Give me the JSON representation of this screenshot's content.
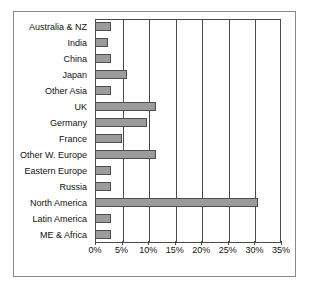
{
  "chart_data": {
    "type": "bar",
    "orientation": "horizontal",
    "title": "",
    "subtitle": "",
    "xlabel": "",
    "ylabel": "",
    "xlim": [
      0,
      35
    ],
    "xtick_labels": [
      "0%",
      "5%",
      "10%",
      "15%",
      "20%",
      "25%",
      "30%",
      "35%"
    ],
    "xtick_values": [
      0,
      5,
      10,
      15,
      20,
      25,
      30,
      35
    ],
    "grid": true,
    "grid_axis": "x",
    "legend": false,
    "legend_position": "none",
    "categories": [
      "Australia & NZ",
      "India",
      "China",
      "Japan",
      "Other Asia",
      "UK",
      "Germany",
      "France",
      "Other W. Europe",
      "Eastern Europe",
      "Russia",
      "North America",
      "Latin America",
      "ME & Africa"
    ],
    "values": [
      3.0,
      2.5,
      3.0,
      6.0,
      3.0,
      11.5,
      9.8,
      5.0,
      11.5,
      3.0,
      3.0,
      30.7,
      3.0,
      3.0
    ],
    "bar_color": "#9b9b9b",
    "bar_border_color": "#4d4d4d",
    "axis_color": "#4a4a4a",
    "frame_color": "#8a8a8a",
    "background": "#ffffff"
  }
}
